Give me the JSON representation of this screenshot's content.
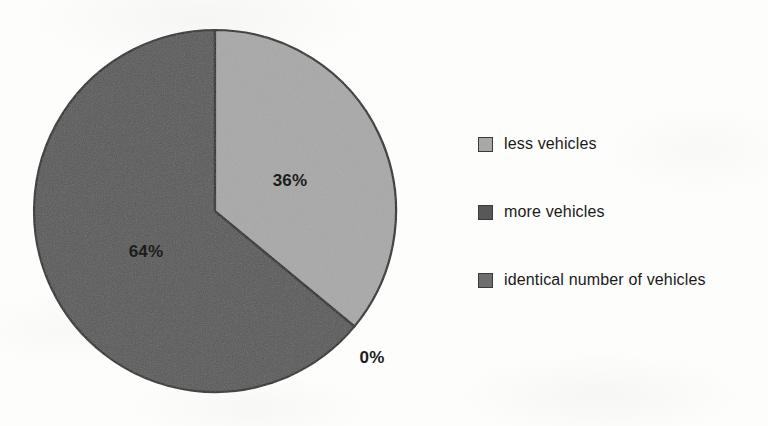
{
  "chart_data": {
    "type": "pie",
    "title": "",
    "categories": [
      "less vehicles",
      "more vehicles",
      "identical number of vehicles"
    ],
    "values": [
      36,
      64,
      0
    ],
    "value_labels": [
      "36%",
      "64%",
      "0%"
    ],
    "units": "percent",
    "start_angle_deg": 0,
    "direction": "clockwise",
    "legend_position": "right",
    "grid": false,
    "colors": [
      "#a8a8a8",
      "#585858",
      "#6e6e6e"
    ],
    "slice_border_color": "#2b2b2b",
    "slices": [
      {
        "label": "less vehicles",
        "value": 36,
        "value_label": "36%",
        "color": "#a8a8a8",
        "start_deg": 0,
        "end_deg": 129.6
      },
      {
        "label": "more vehicles",
        "value": 64,
        "value_label": "64%",
        "color": "#585858",
        "start_deg": 129.6,
        "end_deg": 360
      },
      {
        "label": "identical number of vehicles",
        "value": 0,
        "value_label": "0%",
        "color": "#6e6e6e",
        "start_deg": 129.6,
        "end_deg": 129.6
      }
    ]
  },
  "pie": {
    "center_x": 215,
    "center_y": 211,
    "radius": 181,
    "labels": [
      {
        "text": "36%",
        "x": 290,
        "y": 181
      },
      {
        "text": "64%",
        "x": 146,
        "y": 252
      },
      {
        "text": "0%",
        "x": 372,
        "y": 358
      }
    ]
  },
  "legend": {
    "items": [
      {
        "label": "less vehicles",
        "color": "#a8a8a8"
      },
      {
        "label": "more vehicles",
        "color": "#585858"
      },
      {
        "label": "identical number of vehicles",
        "color": "#6e6e6e"
      }
    ]
  }
}
